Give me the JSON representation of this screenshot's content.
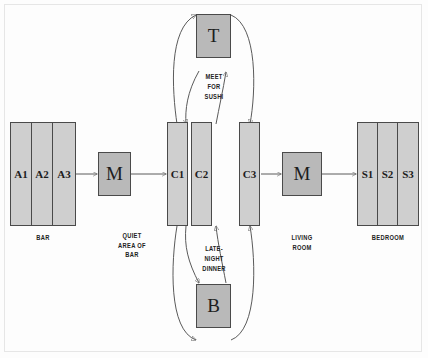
{
  "diagram": {
    "colors": {
      "group_fill": "#cfcfcf",
      "node_fill": "#b9b9b9",
      "stroke": "#4a4a4a",
      "wire": "#5a5a5a",
      "frame": "#e6e6e6",
      "background": "#fdfdfd"
    },
    "groups": [
      {
        "name": "bar-group",
        "caption": "BAR",
        "cells": [
          {
            "label": "A1"
          },
          {
            "label": "A2"
          },
          {
            "label": "A3"
          }
        ]
      },
      {
        "name": "quiet-area-group",
        "caption": "QUIET AREA OF BAR",
        "caption_lines": [
          "QUIET",
          "AREA OF",
          "BAR"
        ],
        "cells": [
          {
            "label": "C1"
          },
          {
            "label": "C2"
          },
          {
            "label": "C3"
          }
        ]
      },
      {
        "name": "bedroom-group",
        "caption": "BEDROOM",
        "cells": [
          {
            "label": "S1"
          },
          {
            "label": "S2"
          },
          {
            "label": "S3"
          }
        ]
      }
    ],
    "nodes": [
      {
        "name": "left-mediator",
        "label": "M"
      },
      {
        "name": "right-mediator",
        "label": "M"
      },
      {
        "name": "top-state",
        "label": "T"
      },
      {
        "name": "bottom-state",
        "label": "B"
      }
    ],
    "captions": [
      {
        "name": "bar-caption",
        "text": "BAR"
      },
      {
        "name": "quiet-area-caption",
        "lines": [
          "QUIET",
          "AREA OF",
          "BAR"
        ]
      },
      {
        "name": "living-room-caption",
        "lines": [
          "LIVING",
          "ROOM"
        ]
      },
      {
        "name": "bedroom-caption",
        "text": "BEDROOM"
      }
    ],
    "edge_labels": [
      {
        "name": "meet-for-sushi-label",
        "lines": [
          "MEET",
          "FOR",
          "SUSHI"
        ]
      },
      {
        "name": "late-night-dinner-label",
        "lines": [
          "LATE-",
          "NIGHT",
          "DINNER"
        ]
      }
    ]
  }
}
